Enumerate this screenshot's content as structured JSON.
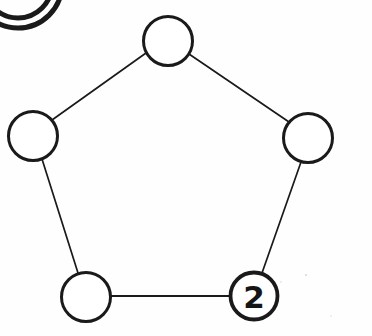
{
  "figure": {
    "type": "node-link-diagram",
    "background_color": "#fefefe",
    "ink_color": "#1a1a1a",
    "width": 372,
    "height": 336,
    "style": "hand-drawn scanned line art, black ink on white paper"
  },
  "nodes": [
    {
      "id": "node-top",
      "label": "",
      "cx": 168,
      "cy": 41,
      "r": 24.5,
      "stroke_width": 3.0,
      "position_name": "top"
    },
    {
      "id": "node-left",
      "label": "",
      "cx": 33,
      "cy": 136,
      "r": 24.5,
      "stroke_width": 3.0,
      "position_name": "upper-left"
    },
    {
      "id": "node-right",
      "label": "",
      "cx": 308,
      "cy": 138,
      "r": 24.5,
      "stroke_width": 3.0,
      "position_name": "upper-right"
    },
    {
      "id": "node-bottom-left",
      "label": "",
      "cx": 86,
      "cy": 297,
      "r": 24.5,
      "stroke_width": 3.0,
      "position_name": "lower-left"
    },
    {
      "id": "node-bottom-right",
      "label": "2",
      "cx": 254,
      "cy": 296,
      "r": 23.5,
      "stroke_width": 3.8,
      "position_name": "lower-right"
    }
  ],
  "edges": [
    {
      "id": "edge-top-left",
      "from": "node-top",
      "to": "node-left",
      "x1": 146,
      "y1": 53,
      "x2": 52,
      "y2": 120,
      "stroke_width": 1.7
    },
    {
      "id": "edge-top-right",
      "from": "node-top",
      "to": "node-right",
      "x1": 189,
      "y1": 54,
      "x2": 289,
      "y2": 122,
      "stroke_width": 1.7
    },
    {
      "id": "edge-left-bottom",
      "from": "node-left",
      "to": "node-bottom-left",
      "x1": 42,
      "y1": 159,
      "x2": 78,
      "y2": 273,
      "stroke_width": 1.7
    },
    {
      "id": "edge-right-bottom",
      "from": "node-right",
      "to": "node-bottom-right",
      "x1": 301,
      "y1": 162,
      "x2": 262,
      "y2": 273,
      "stroke_width": 1.7
    },
    {
      "id": "edge-bottom",
      "from": "node-bottom-left",
      "to": "node-bottom-right",
      "x1": 111,
      "y1": 296,
      "x2": 230,
      "y2": 296,
      "stroke_width": 2.0
    }
  ],
  "artifacts": {
    "corner_fragment": {
      "id": "partial-circle-fragment",
      "description": "two concentric arcs of a circle clipped by the top-left corner of the page",
      "cx": 18,
      "cy": -16,
      "outer_r": 44,
      "inner_r": 34,
      "stroke_width": 5.0
    },
    "specks": [
      {
        "id": "speck-1",
        "cx": 306,
        "cy": 275,
        "r": 1.1
      },
      {
        "id": "speck-2",
        "cx": 281,
        "cy": 282,
        "r": 0.8
      },
      {
        "id": "speck-3",
        "cx": 331,
        "cy": 316,
        "r": 0.7
      }
    ]
  }
}
